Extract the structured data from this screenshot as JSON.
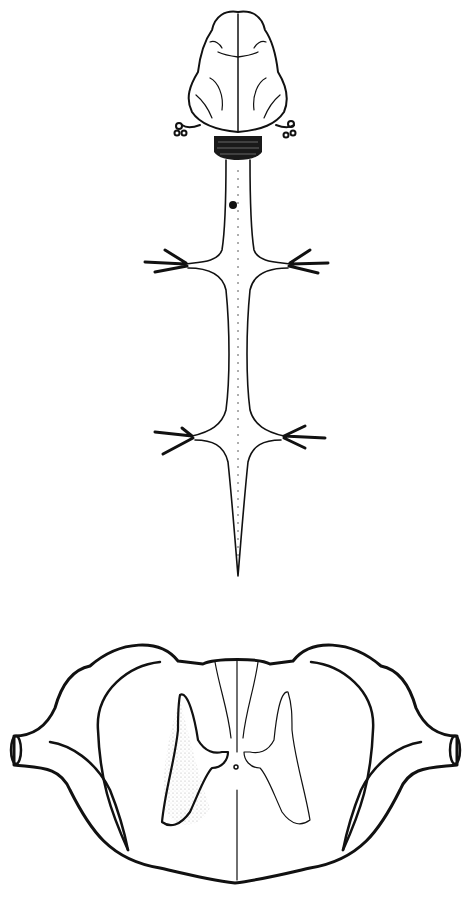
{
  "figure": {
    "type": "anatomical line illustration",
    "panels": [
      {
        "id": "dorsal-view",
        "subject": "brain and spinal cord, dorsal view",
        "features": [
          "cerebral hemispheres",
          "cerebellum (dark hatched)",
          "cranial nerve roots",
          "lesion dot on cervical cord",
          "cervical enlargement with limb nerves",
          "lumbar enlargement with limb nerves",
          "tapering conus"
        ]
      },
      {
        "id": "cross-section",
        "subject": "spinal cord transverse section",
        "features": [
          "butterfly grey matter",
          "central canal",
          "dorsal columns",
          "spinal nerve roots",
          "stippled region (left lateral)"
        ]
      }
    ],
    "colors": {
      "line": "#111111",
      "background": "#ffffff",
      "stipple": "#9a9a9a"
    }
  }
}
